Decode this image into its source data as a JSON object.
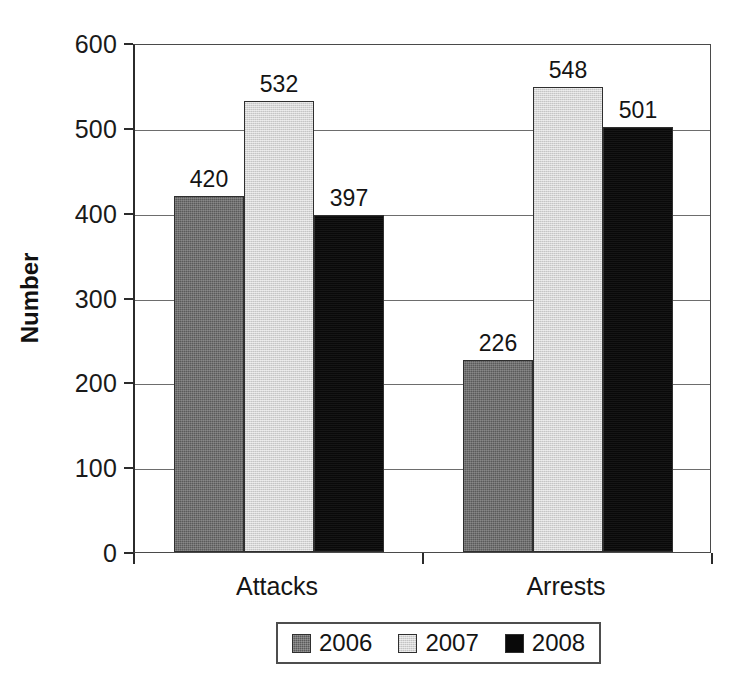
{
  "chart_data": {
    "type": "bar",
    "title": "",
    "subtitle": "",
    "xlabel": "",
    "ylabel": "Number",
    "categories": [
      "Attacks",
      "Arrests"
    ],
    "series": [
      {
        "name": "2006",
        "values": [
          420,
          226
        ],
        "color": "#5a5a5a"
      },
      {
        "name": "2007",
        "values": [
          532,
          548
        ],
        "color": "#d6d6d6"
      },
      {
        "name": "2008",
        "values": [
          397,
          501
        ],
        "color": "#090909"
      }
    ],
    "ylim": [
      0,
      600
    ],
    "ytick_labels": [
      "0",
      "100",
      "200",
      "300",
      "400",
      "500",
      "600"
    ],
    "ytick_values": [
      0,
      100,
      200,
      300,
      400,
      500,
      600
    ],
    "grid": true,
    "grid_axis": "y",
    "legend_position": "bottom",
    "data_labels": true,
    "data_label_values": [
      [
        "420",
        "532",
        "397"
      ],
      [
        "226",
        "548",
        "501"
      ]
    ]
  },
  "axis": {
    "y_title": "Number"
  },
  "legend": {
    "entries": [
      {
        "label": "2006"
      },
      {
        "label": "2007"
      },
      {
        "label": "2008"
      }
    ]
  }
}
